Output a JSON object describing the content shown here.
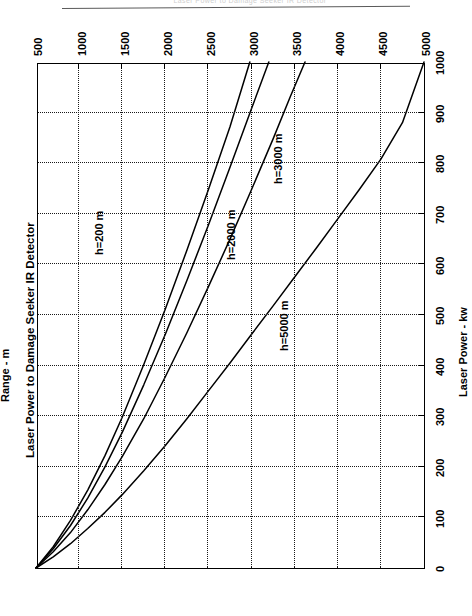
{
  "page": {
    "header_text": "Laser Power to Damage Seeker IR Detector"
  },
  "chart_data": {
    "type": "line",
    "title": "Laser Power to Damage Seeker IR Detector",
    "xlabel": "Range - m",
    "ylabel": "Laser Power - kw",
    "xlim": [
      500,
      5000
    ],
    "ylim": [
      0,
      1000
    ],
    "xticks": [
      500,
      1000,
      1500,
      2000,
      2500,
      3000,
      3500,
      4000,
      4500,
      5000
    ],
    "xtick_labels": [
      "500",
      "1000",
      "1500",
      "2000",
      "2500",
      "3000",
      "3500",
      "4000",
      "4500",
      "5000"
    ],
    "yticks": [
      0,
      100,
      200,
      300,
      400,
      500,
      600,
      700,
      800,
      900,
      1000
    ],
    "ytick_labels": [
      "0",
      "100",
      "200",
      "300",
      "400",
      "500",
      "600",
      "700",
      "800",
      "900",
      "1000"
    ],
    "grid": true,
    "grid_style": "dotted",
    "legend": "inline-curve-labels",
    "line_color": "#000000",
    "series": [
      {
        "name": "h=200 m",
        "label": "h=200 m",
        "label_at": {
          "x": 1150,
          "y": 620
        },
        "points": [
          {
            "x": 500,
            "y": 0
          },
          {
            "x": 700,
            "y": 22
          },
          {
            "x": 900,
            "y": 48
          },
          {
            "x": 1100,
            "y": 78
          },
          {
            "x": 1300,
            "y": 110
          },
          {
            "x": 1500,
            "y": 145
          },
          {
            "x": 1750,
            "y": 192
          },
          {
            "x": 2000,
            "y": 242
          },
          {
            "x": 2250,
            "y": 295
          },
          {
            "x": 2500,
            "y": 350
          },
          {
            "x": 2750,
            "y": 405
          },
          {
            "x": 3000,
            "y": 462
          },
          {
            "x": 3250,
            "y": 518
          },
          {
            "x": 3500,
            "y": 575
          },
          {
            "x": 3750,
            "y": 632
          },
          {
            "x": 4000,
            "y": 690
          },
          {
            "x": 4250,
            "y": 748
          },
          {
            "x": 4500,
            "y": 808
          },
          {
            "x": 4750,
            "y": 880
          },
          {
            "x": 5000,
            "y": 1000
          }
        ]
      },
      {
        "name": "h=2000 m",
        "label": "h=2000 m",
        "label_at": {
          "x": 2680,
          "y": 610
        },
        "points": [
          {
            "x": 500,
            "y": 0
          },
          {
            "x": 700,
            "y": 32
          },
          {
            "x": 900,
            "y": 70
          },
          {
            "x": 1100,
            "y": 115
          },
          {
            "x": 1300,
            "y": 165
          },
          {
            "x": 1500,
            "y": 220
          },
          {
            "x": 1750,
            "y": 295
          },
          {
            "x": 2000,
            "y": 378
          },
          {
            "x": 2250,
            "y": 465
          },
          {
            "x": 2500,
            "y": 556
          },
          {
            "x": 2750,
            "y": 650
          },
          {
            "x": 3000,
            "y": 748
          },
          {
            "x": 3250,
            "y": 848
          },
          {
            "x": 3450,
            "y": 932
          },
          {
            "x": 3620,
            "y": 1000
          }
        ]
      },
      {
        "name": "h=3000 m",
        "label": "h=3000 m",
        "label_at": {
          "x": 3230,
          "y": 760
        },
        "points": [
          {
            "x": 500,
            "y": 0
          },
          {
            "x": 700,
            "y": 38
          },
          {
            "x": 900,
            "y": 84
          },
          {
            "x": 1100,
            "y": 138
          },
          {
            "x": 1300,
            "y": 200
          },
          {
            "x": 1500,
            "y": 268
          },
          {
            "x": 1750,
            "y": 362
          },
          {
            "x": 2000,
            "y": 462
          },
          {
            "x": 2250,
            "y": 568
          },
          {
            "x": 2500,
            "y": 678
          },
          {
            "x": 2750,
            "y": 792
          },
          {
            "x": 3000,
            "y": 908
          },
          {
            "x": 3200,
            "y": 1000
          }
        ]
      },
      {
        "name": "h=5000 m",
        "label": "h=5000 m",
        "label_at": {
          "x": 3300,
          "y": 430
        },
        "points": [
          {
            "x": 500,
            "y": 0
          },
          {
            "x": 700,
            "y": 42
          },
          {
            "x": 900,
            "y": 94
          },
          {
            "x": 1100,
            "y": 154
          },
          {
            "x": 1300,
            "y": 222
          },
          {
            "x": 1500,
            "y": 298
          },
          {
            "x": 1750,
            "y": 402
          },
          {
            "x": 2000,
            "y": 512
          },
          {
            "x": 2250,
            "y": 628
          },
          {
            "x": 2500,
            "y": 748
          },
          {
            "x": 2750,
            "y": 872
          },
          {
            "x": 2980,
            "y": 1000
          }
        ]
      }
    ]
  }
}
